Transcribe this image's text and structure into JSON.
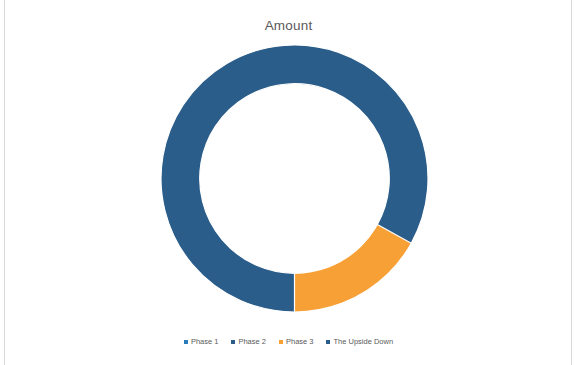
{
  "chart": {
    "title": "Amount",
    "legend_position": "bottom"
  },
  "chart_data": {
    "type": "pie",
    "variant": "doughnut",
    "title": "Amount",
    "xlabel": "",
    "ylabel": "",
    "grid": false,
    "legend_position": "bottom",
    "hole_ratio": 0.71,
    "start_angle_deg": 90,
    "direction": "clockwise",
    "categories": [
      "Phase 1",
      "Phase 2",
      "Phase 3",
      "The Upside Down"
    ],
    "values": [
      50.0,
      16.7,
      16.4,
      16.9
    ],
    "colors": [
      "#2a7cb8",
      "#a6a6a6",
      "#f7a035",
      "#2a5d8a"
    ],
    "slices": [
      {
        "label": "Phase 1",
        "value": 50.0,
        "percent": 50.0,
        "color": "#2a7cb8",
        "start_deg": 90,
        "end_deg": 270
      },
      {
        "label": "Phase 2",
        "value": 16.7,
        "percent": 16.7,
        "color": "#a6a6a6",
        "start_deg": 331,
        "end_deg": 31
      },
      {
        "label": "Phase 3",
        "value": 16.4,
        "percent": 16.4,
        "color": "#f7a035",
        "start_deg": 31,
        "end_deg": 90
      },
      {
        "label": "The Upside Down",
        "value": 16.9,
        "percent": 16.9,
        "color": "#2a5d8a",
        "start_deg": 270,
        "end_deg": 331
      }
    ]
  },
  "legend": {
    "items": [
      {
        "label": "Phase 1",
        "color": "#2a7cb8"
      },
      {
        "label": "Phase 2",
        "color": "#2a5d8a"
      },
      {
        "label": "Phase 3",
        "color": "#f7a035"
      },
      {
        "label": "The Upside Down",
        "color": "#2a5d8a"
      }
    ]
  }
}
